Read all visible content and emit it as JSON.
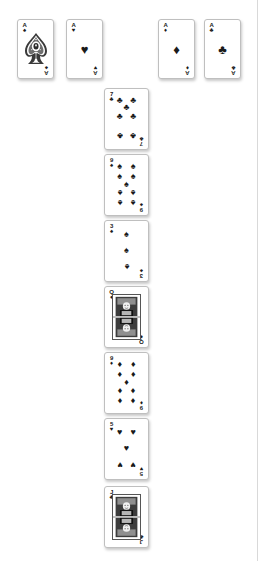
{
  "app": {
    "title": "Solitaire",
    "surface_color": "#ffffff",
    "card_face_color": "#ffffff",
    "card_border_color": "#bfbfbf",
    "pip_color": "#1a1a1a"
  },
  "suits": {
    "spades": {
      "name": "spades",
      "glyph": "♠",
      "color": "#1a1a1a"
    },
    "hearts": {
      "name": "hearts",
      "glyph": "♥",
      "color": "#1a1a1a"
    },
    "diamonds": {
      "name": "diamonds",
      "glyph": "♦",
      "color": "#1a1a1a"
    },
    "clubs": {
      "name": "clubs",
      "glyph": "♣",
      "color": "#1a1a1a"
    }
  },
  "foundations": {
    "label": "foundation-row",
    "cards": [
      {
        "rank": "A",
        "suit": "spades",
        "glyph": "♠",
        "name": "ace-of-spades",
        "x": 17,
        "y": 19,
        "w": 37,
        "h": 60
      },
      {
        "rank": "A",
        "suit": "hearts",
        "glyph": "♥",
        "name": "ace-of-hearts",
        "x": 66,
        "y": 19,
        "w": 37,
        "h": 60
      },
      {
        "rank": "A",
        "suit": "diamonds",
        "glyph": "♦",
        "name": "ace-of-diamonds",
        "x": 158,
        "y": 19,
        "w": 37,
        "h": 60
      },
      {
        "rank": "A",
        "suit": "clubs",
        "glyph": "♣",
        "name": "ace-of-clubs",
        "x": 204,
        "y": 19,
        "w": 37,
        "h": 60
      }
    ]
  },
  "tableau": {
    "label": "tableau-column",
    "column_x": 104,
    "card_width": 45,
    "card_height": 62,
    "row_pitch": 66,
    "cards": [
      {
        "rank": "7",
        "suit": "clubs",
        "glyph": "♣",
        "name": "seven-of-clubs",
        "y": 88,
        "pip_layout": "7"
      },
      {
        "rank": "9",
        "suit": "spades",
        "glyph": "♠",
        "name": "nine-of-spades",
        "y": 154,
        "pip_layout": "9"
      },
      {
        "rank": "3",
        "suit": "spades",
        "glyph": "♠",
        "name": "three-of-spades",
        "y": 220,
        "pip_layout": "3"
      },
      {
        "rank": "Q",
        "suit": "diamonds",
        "glyph": "♦",
        "name": "queen-of-diamonds",
        "y": 286,
        "pip_layout": "court"
      },
      {
        "rank": "9",
        "suit": "diamonds",
        "glyph": "♦",
        "name": "nine-of-diamonds",
        "y": 352,
        "pip_layout": "9"
      },
      {
        "rank": "5",
        "suit": "hearts",
        "glyph": "♥",
        "name": "five-of-hearts",
        "y": 418,
        "pip_layout": "5"
      },
      {
        "rank": "J",
        "suit": "clubs",
        "glyph": "♣",
        "name": "jack-of-clubs",
        "y": 486,
        "pip_layout": "court"
      }
    ]
  },
  "pip_layouts": {
    "3": [
      [
        50,
        15
      ],
      [
        50,
        50
      ],
      [
        50,
        85
      ]
    ],
    "5": [
      [
        25,
        15
      ],
      [
        75,
        15
      ],
      [
        50,
        50
      ],
      [
        25,
        85
      ],
      [
        75,
        85
      ]
    ],
    "7": [
      [
        25,
        10
      ],
      [
        75,
        10
      ],
      [
        50,
        27
      ],
      [
        25,
        45
      ],
      [
        75,
        45
      ],
      [
        25,
        88
      ],
      [
        75,
        88
      ]
    ],
    "9": [
      [
        25,
        10
      ],
      [
        75,
        10
      ],
      [
        25,
        33
      ],
      [
        75,
        33
      ],
      [
        50,
        50
      ],
      [
        25,
        67
      ],
      [
        75,
        67
      ],
      [
        25,
        90
      ],
      [
        75,
        90
      ]
    ]
  }
}
